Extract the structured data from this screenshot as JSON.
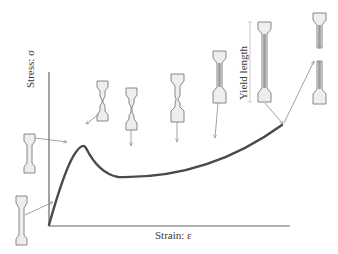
{
  "figure": {
    "type": "stress-strain curve with tensile specimen illustrations",
    "axes": {
      "y_label": "Stress: σ",
      "x_label": "Strain: ε"
    },
    "annotation": {
      "yield_length_label": "Yield length"
    },
    "colors": {
      "curve": "#4a4a4a",
      "axis": "#555555",
      "specimen_fill": "#eeeeee",
      "specimen_stroke": "#7a7a7a",
      "arrow": "#8a8a8a",
      "text": "#3a3a3a"
    },
    "specimens": [
      {
        "stage": "elastic",
        "shape": "uniform"
      },
      {
        "stage": "upper yield",
        "shape": "uniform"
      },
      {
        "stage": "neck initiation",
        "shape": "necked"
      },
      {
        "stage": "neck propagation",
        "shape": "necked-drawn"
      },
      {
        "stage": "cold drawing",
        "shape": "drawn"
      },
      {
        "stage": "cold drawing",
        "shape": "drawn"
      },
      {
        "stage": "fully drawn",
        "shape": "drawn-long"
      },
      {
        "stage": "fracture",
        "shape": "broken"
      }
    ]
  }
}
